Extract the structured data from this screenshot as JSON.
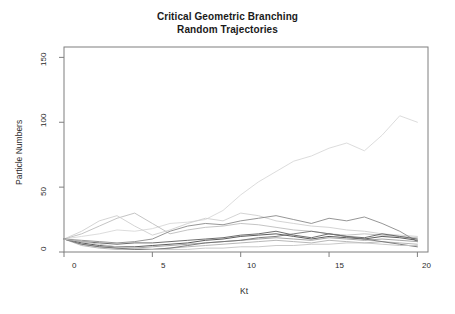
{
  "chart_data": {
    "type": "line",
    "title": "Critical Geometric Branching",
    "subtitle": "Random Trajectories",
    "title_lines": [
      "Critical Geometric Branching",
      "Random Trajectories"
    ],
    "xlabel": "Kt",
    "ylabel": "Particle Numbers",
    "xlim": [
      0,
      20.6
    ],
    "ylim": [
      0,
      158
    ],
    "xticks": [
      0,
      5,
      10,
      15,
      20
    ],
    "xtick_labels": [
      "0",
      "5",
      "10",
      "15",
      "20"
    ],
    "yticks": [
      0,
      50,
      100,
      150
    ],
    "ytick_labels": [
      "0",
      "50",
      "100",
      "150"
    ],
    "grid": false,
    "legend": "none",
    "box": true,
    "x": [
      0,
      1,
      2,
      3,
      4,
      5,
      6,
      7,
      8,
      9,
      10,
      11,
      12,
      13,
      14,
      15,
      16,
      17,
      18,
      19,
      20
    ],
    "series": [
      {
        "name": "trajectory-1-supercritical",
        "color": "#d8d8d8",
        "values": [
          10,
          12,
          14,
          17,
          16,
          18,
          22,
          23,
          25,
          32,
          44,
          54,
          62,
          70,
          74,
          80,
          84,
          78,
          90,
          105,
          100
        ]
      },
      {
        "name": "trajectory-2",
        "color": "#bdbdbd",
        "values": [
          10,
          14,
          20,
          26,
          30,
          22,
          14,
          17,
          19,
          20,
          22,
          21,
          19,
          17,
          16,
          14,
          13,
          14,
          13,
          12,
          11
        ]
      },
      {
        "name": "trajectory-3",
        "color": "#cfcfcf",
        "values": [
          10,
          16,
          24,
          28,
          20,
          13,
          17,
          22,
          26,
          24,
          30,
          28,
          24,
          22,
          20,
          19,
          17,
          16,
          14,
          13,
          12
        ]
      },
      {
        "name": "trajectory-4",
        "color": "#8a8a8a",
        "values": [
          10,
          9,
          8,
          7,
          8,
          10,
          16,
          20,
          22,
          21,
          24,
          26,
          28,
          25,
          22,
          26,
          24,
          27,
          22,
          16,
          8
        ]
      },
      {
        "name": "trajectory-5",
        "color": "#5e5e5e",
        "values": [
          10,
          8,
          7,
          6,
          7,
          7,
          8,
          9,
          10,
          11,
          13,
          14,
          16,
          13,
          11,
          14,
          12,
          11,
          14,
          12,
          10
        ]
      },
      {
        "name": "trajectory-6",
        "color": "#4a4a4a",
        "values": [
          10,
          7,
          5,
          4,
          4,
          5,
          6,
          7,
          9,
          10,
          12,
          13,
          14,
          12,
          10,
          12,
          11,
          10,
          12,
          11,
          9
        ]
      },
      {
        "name": "trajectory-7",
        "color": "#9c9c9c",
        "values": [
          10,
          6,
          4,
          3,
          3,
          4,
          5,
          6,
          7,
          8,
          9,
          10,
          11,
          10,
          9,
          11,
          10,
          9,
          10,
          9,
          8
        ]
      },
      {
        "name": "trajectory-8",
        "color": "#b0b0b0",
        "values": [
          10,
          5,
          3,
          2,
          2,
          2,
          3,
          4,
          5,
          6,
          7,
          8,
          9,
          8,
          7,
          9,
          8,
          7,
          8,
          7,
          6
        ]
      },
      {
        "name": "trajectory-9",
        "color": "#707070",
        "values": [
          10,
          6,
          4,
          3,
          2,
          2,
          3,
          5,
          7,
          8,
          9,
          11,
          12,
          14,
          16,
          14,
          12,
          10,
          8,
          6,
          4
        ]
      },
      {
        "name": "trajectory-10",
        "color": "#c4c4c4",
        "values": [
          10,
          8,
          6,
          4,
          3,
          2,
          2,
          2,
          3,
          3,
          4,
          4,
          5,
          5,
          6,
          6,
          7,
          7,
          6,
          5,
          5
        ]
      }
    ],
    "axis_color": "#7f7f7f",
    "text_color": "#2b2b2b"
  }
}
